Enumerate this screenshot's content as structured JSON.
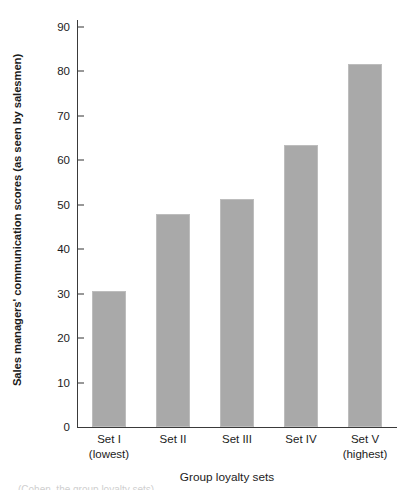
{
  "figure": {
    "background_color": "#ffffff",
    "axis_color": "#3a3a3a"
  },
  "chart_data": {
    "type": "bar",
    "title": "",
    "subtitle": "",
    "xlabel": "Group loyalty sets",
    "ylabel": "Sales managers' communication scores (as seen by salesmen)",
    "categories": [
      "Set I",
      "Set II",
      "Set III",
      "Set IV",
      "Set V"
    ],
    "category_sublabels": [
      "(lowest)",
      "",
      "",
      "",
      "(highest)"
    ],
    "values": [
      30.6,
      48.0,
      51.2,
      63.5,
      81.7
    ],
    "ylim": [
      0,
      90
    ],
    "yticks": [
      0,
      10,
      20,
      30,
      40,
      50,
      60,
      70,
      80,
      90
    ],
    "ytick_labels": [
      "0",
      "10",
      "20",
      "30",
      "40",
      "50",
      "60",
      "70",
      "80",
      "90"
    ],
    "grid": false,
    "legend": null,
    "bar_color": "#a9a9a9",
    "bar_edge_color": "#bdbdbd",
    "bar_width_fraction": 0.53
  },
  "bottom_crop_text": "(Cohen, the group loyalty sets)"
}
